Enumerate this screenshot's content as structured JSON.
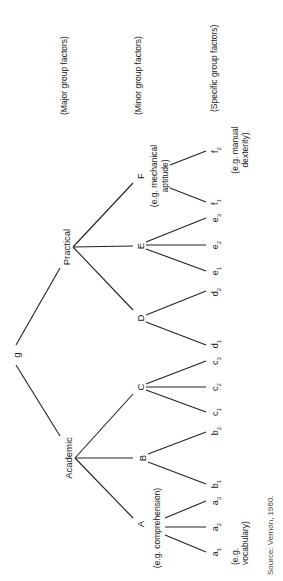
{
  "diagram": {
    "type": "hierarchical-tree",
    "orientation": "rotated-90-ccw",
    "root": {
      "label": "g"
    },
    "major_groups": [
      {
        "label": "Practical"
      },
      {
        "label": "Academic"
      }
    ],
    "minor_groups": [
      {
        "label": "F",
        "example": "(e.g. mechanical",
        "example2": "aptitude)"
      },
      {
        "label": "E"
      },
      {
        "label": "D"
      },
      {
        "label": "C"
      },
      {
        "label": "B"
      },
      {
        "label": "A",
        "example": "(e.g. comprehension)"
      }
    ],
    "specific_factors": {
      "f2": {
        "base": "f",
        "sub": "2"
      },
      "f1": {
        "base": "f",
        "sub": "1"
      },
      "e3": {
        "base": "e",
        "sub": "3"
      },
      "e2": {
        "base": "e",
        "sub": "2"
      },
      "e1": {
        "base": "e",
        "sub": "1"
      },
      "d2": {
        "base": "d",
        "sub": "2"
      },
      "d1": {
        "base": "d",
        "sub": "1"
      },
      "c3": {
        "base": "c",
        "sub": "3"
      },
      "c2": {
        "base": "c",
        "sub": "2"
      },
      "c1": {
        "base": "c",
        "sub": "1"
      },
      "b2": {
        "base": "b",
        "sub": "2"
      },
      "b1": {
        "base": "b",
        "sub": "1"
      },
      "a3": {
        "base": "a",
        "sub": "3"
      },
      "a2": {
        "base": "a",
        "sub": "2"
      },
      "a1": {
        "base": "a",
        "sub": "1"
      }
    },
    "leaf_examples": {
      "f": {
        "line1": "(e.g. manual",
        "line2": "dexterity)"
      },
      "a": {
        "line1": "(e.g.",
        "line2": "vocabulary)"
      }
    },
    "level_labels": {
      "major": "(Major group factors)",
      "minor": "(Minor group factors)",
      "specific": "(Specific group factors)"
    },
    "source": "Source: Vernon, 1960."
  }
}
